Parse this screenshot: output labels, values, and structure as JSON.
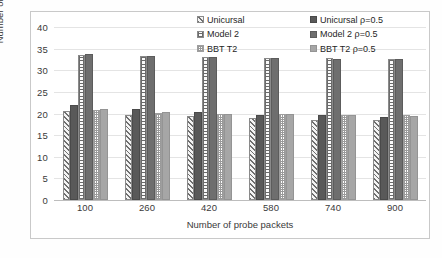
{
  "chart_data": {
    "type": "bar",
    "title": "",
    "xlabel": "Number of probe packets",
    "ylabel": "Number of accesses",
    "categories": [
      "100",
      "260",
      "420",
      "580",
      "740",
      "900"
    ],
    "ylim": [
      0,
      40
    ],
    "yticks": [
      0,
      5,
      10,
      15,
      20,
      25,
      30,
      35,
      40
    ],
    "grid": true,
    "legend_position": "top-right",
    "series": [
      {
        "name": "Unicursal",
        "pattern": "diagonal-hatch",
        "color": "#f2f2f2",
        "values": [
          20.6,
          19.7,
          19.4,
          19.0,
          18.6,
          18.4
        ]
      },
      {
        "name": "Unicursal ρ=0.5",
        "pattern": "solid",
        "color": "#595959",
        "values": [
          21.9,
          21.0,
          20.3,
          19.6,
          19.6,
          19.1
        ]
      },
      {
        "name": "Model 2",
        "pattern": "grid",
        "color": "#fafafa",
        "values": [
          33.5,
          33.3,
          33.0,
          32.9,
          32.8,
          32.5
        ]
      },
      {
        "name": "Model 2 ρ=0.5",
        "pattern": "solid",
        "color": "#6e6e6e",
        "values": [
          33.8,
          33.2,
          33.0,
          32.9,
          32.7,
          32.5
        ]
      },
      {
        "name": "BBT T2",
        "pattern": "checker",
        "color": "#ffffff",
        "values": [
          20.9,
          20.2,
          19.9,
          19.8,
          19.6,
          19.6
        ]
      },
      {
        "name": "BBT T2 ρ=0.5",
        "pattern": "solid",
        "color": "#a6a6a6",
        "values": [
          21.0,
          20.3,
          19.9,
          19.8,
          19.6,
          19.5
        ]
      }
    ]
  },
  "legend": {
    "items": [
      {
        "label": "Unicursal"
      },
      {
        "label": "Model 2"
      },
      {
        "label": "BBT T2"
      },
      {
        "label": "Unicursal ρ=0.5"
      },
      {
        "label": "Model 2 ρ=0.5"
      },
      {
        "label": "BBT T2 ρ=0.5"
      }
    ]
  },
  "colors": {
    "gridline": "#e4e4e4",
    "axis": "#bdbdbd",
    "text": "#3a3a3a",
    "frame": "#c9c9c9"
  }
}
